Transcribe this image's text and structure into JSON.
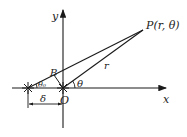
{
  "diagram": {
    "colors": {
      "line": "#1a1a1a",
      "background": "#ffffff"
    },
    "labels": {
      "y_axis": "y",
      "x_axis": "x",
      "point": "P(r, θ)",
      "radius": "r",
      "angle_theta": "θ",
      "angle_theta0": "θ₀",
      "point_b": "B",
      "origin": "O",
      "offset": "δ"
    }
  }
}
